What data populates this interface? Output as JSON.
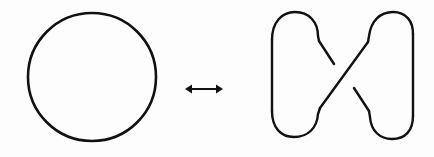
{
  "diagram": {
    "stroke_color": "#111111",
    "background_color": "#fdfdfd",
    "left_figure": {
      "name": "circle (unknot)",
      "shape": "circle",
      "cx": 92,
      "cy": 77,
      "r": 64,
      "stroke_width": 2.6
    },
    "relation": {
      "name": "double-headed arrow",
      "symbol": "↔",
      "x1": 186,
      "x2": 222,
      "y": 89,
      "stroke_width": 2
    },
    "right_figure": {
      "name": "one-crossing unknot diagram",
      "crossings": 1,
      "stroke_width": 2.4
    }
  }
}
